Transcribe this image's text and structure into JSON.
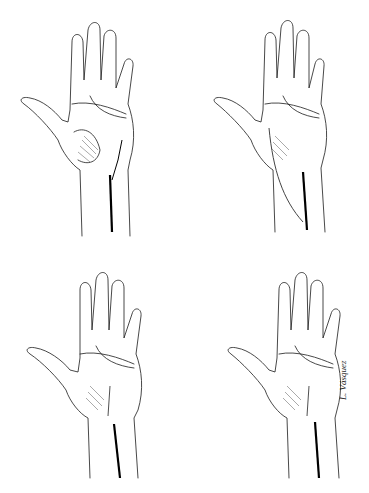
{
  "figure": {
    "panels": [
      {
        "id": "top-left",
        "incision": "curved thenar-crease incision extending proximally straight down forearm"
      },
      {
        "id": "top-right",
        "incision": "incision along thenar crease curving radially, plus separate straight forearm line"
      },
      {
        "id": "bottom-left",
        "incision": "short thenar-crease incision with straight proximal forearm line"
      },
      {
        "id": "bottom-right",
        "incision": "short palmar incision with separate straight forearm line"
      }
    ],
    "signature": "L. Vásquez",
    "colors": {
      "line": "#1a1a1a",
      "incision": "#000000",
      "shade": "#555555",
      "background": "#ffffff"
    }
  }
}
